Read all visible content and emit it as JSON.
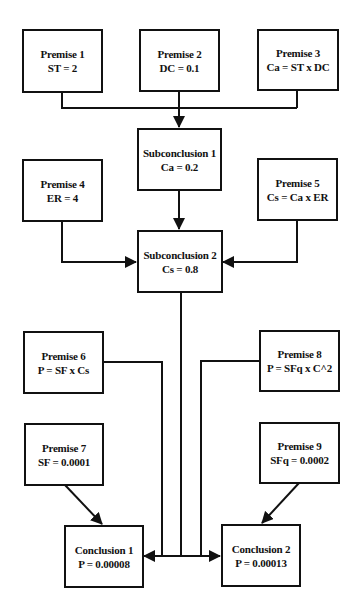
{
  "diagram": {
    "type": "argument-tree",
    "colors": {
      "stroke": "#111111",
      "fill": "#ffffff",
      "text": "#111111"
    },
    "nodes": {
      "premise1": {
        "title": "Premise 1",
        "expr": "ST = 2"
      },
      "premise2": {
        "title": "Premise 2",
        "expr": "DC = 0.1"
      },
      "premise3": {
        "title": "Premise 3",
        "expr": "Ca = ST x DC"
      },
      "subconclusion1": {
        "title": "Subconclusion 1",
        "expr": "Ca = 0.2"
      },
      "premise4": {
        "title": "Premise 4",
        "expr": "ER = 4"
      },
      "premise5": {
        "title": "Premise 5",
        "expr": "Cs = Ca x ER"
      },
      "subconclusion2": {
        "title": "Subconclusion 2",
        "expr": "Cs = 0.8"
      },
      "premise6": {
        "title": "Premise 6",
        "expr": "P = SF x Cs"
      },
      "premise8": {
        "title": "Premise 8",
        "expr": "P = SFq x C^2"
      },
      "premise7": {
        "title": "Premise 7",
        "expr": "SF = 0.0001"
      },
      "premise9": {
        "title": "Premise 9",
        "expr": "SFq = 0.0002"
      },
      "conclusion1": {
        "title": "Conclusion 1",
        "expr": "P = 0.00008"
      },
      "conclusion2": {
        "title": "Conclusion 2",
        "expr": "P = 0.00013"
      }
    },
    "edges": [
      {
        "from": [
          "premise1",
          "premise2",
          "premise3"
        ],
        "to": "subconclusion1"
      },
      {
        "from": [
          "subconclusion1"
        ],
        "to": "subconclusion2"
      },
      {
        "from": [
          "premise4"
        ],
        "to": "subconclusion2"
      },
      {
        "from": [
          "premise5"
        ],
        "to": "subconclusion2"
      },
      {
        "from": [
          "subconclusion2",
          "premise6",
          "premise8"
        ],
        "to": [
          "conclusion1",
          "conclusion2"
        ]
      },
      {
        "from": [
          "premise7"
        ],
        "to": "conclusion1"
      },
      {
        "from": [
          "premise9"
        ],
        "to": "conclusion2"
      }
    ]
  }
}
